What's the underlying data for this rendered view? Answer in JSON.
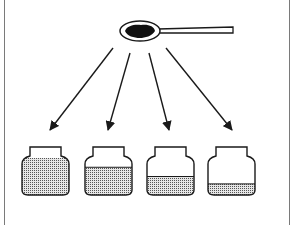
{
  "figure": {
    "spoon": {
      "label": "spoon-with-powder"
    },
    "arrow_count": 4,
    "jars": [
      {
        "name": "jar-1",
        "fill_fraction": 1.0
      },
      {
        "name": "jar-2",
        "fill_fraction": 0.75
      },
      {
        "name": "jar-3",
        "fill_fraction": 0.5
      },
      {
        "name": "jar-4",
        "fill_fraction": 0.3
      }
    ],
    "colors": {
      "ink": "#1a1a1a",
      "fill": "#bdbdbd",
      "frame": "#7a7a7a"
    }
  }
}
